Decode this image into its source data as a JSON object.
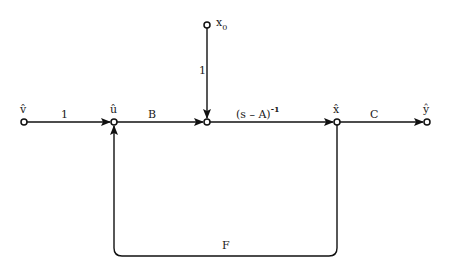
{
  "diagram": {
    "type": "signal-flow-graph",
    "nodes": [
      {
        "id": "v",
        "label": "v̂"
      },
      {
        "id": "u",
        "label": "û"
      },
      {
        "id": "sum",
        "label": ""
      },
      {
        "id": "x",
        "label": "x̂"
      },
      {
        "id": "y",
        "label": "ŷ"
      },
      {
        "id": "x0",
        "label": "x",
        "subscript": "0"
      }
    ],
    "edges": [
      {
        "from": "v",
        "to": "u",
        "gain": "1"
      },
      {
        "from": "u",
        "to": "sum",
        "gain": "B"
      },
      {
        "from": "x0",
        "to": "sum",
        "gain": "1"
      },
      {
        "from": "sum",
        "to": "x",
        "gain": "(s – A)",
        "superscript": "-1"
      },
      {
        "from": "x",
        "to": "y",
        "gain": "C"
      },
      {
        "from": "x",
        "to": "u",
        "gain": "F"
      }
    ]
  }
}
